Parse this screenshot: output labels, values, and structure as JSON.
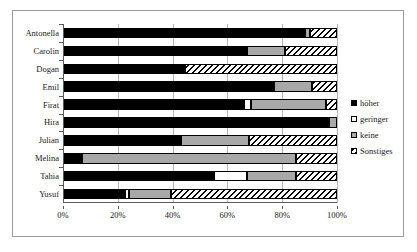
{
  "chart_data": {
    "type": "bar",
    "orientation": "horizontal",
    "stacked": true,
    "stack_mode": "percent",
    "title": "",
    "subtitle": "",
    "xlabel": "",
    "ylabel": "",
    "xlim": [
      0,
      100
    ],
    "xticks": [
      0,
      20,
      40,
      60,
      80,
      100
    ],
    "xtick_labels": [
      "0%",
      "20%",
      "40%",
      "60%",
      "80%",
      "100%"
    ],
    "grid": true,
    "grid_axis": "x",
    "legend_position": "right",
    "categories": [
      "Antonella",
      "Carolin",
      "Dogan",
      "Emil",
      "Firat",
      "Hira",
      "Julian",
      "Melina",
      "Tahia",
      "Yusuf"
    ],
    "series": [
      {
        "name": "höher",
        "color": "#000000",
        "pattern": "solid",
        "values": [
          88.3,
          67.0,
          44.5,
          77.0,
          66.0,
          97.0,
          43.0,
          7.0,
          55.0,
          22.5
        ]
      },
      {
        "name": "geringer",
        "color": "#ffffff",
        "pattern": "solid",
        "values": [
          0.0,
          0.0,
          0.0,
          0.0,
          2.5,
          0.0,
          0.0,
          0.0,
          12.0,
          1.5
        ]
      },
      {
        "name": "keine",
        "color": "#a8a8a8",
        "pattern": "solid",
        "values": [
          1.7,
          14.0,
          0.0,
          14.0,
          27.5,
          3.0,
          25.0,
          78.0,
          18.0,
          15.5
        ]
      },
      {
        "name": "Sonstiges",
        "color": "#ffffff",
        "pattern": "diagonal-hatch",
        "values": [
          10.0,
          19.0,
          55.5,
          9.0,
          4.0,
          0.0,
          32.0,
          15.0,
          15.0,
          60.5
        ]
      }
    ]
  },
  "legend": {
    "items": [
      {
        "label": "höher"
      },
      {
        "label": "geringer"
      },
      {
        "label": "keine"
      },
      {
        "label": "Sonstiges"
      }
    ]
  },
  "colors": {
    "hoeher": "#000000",
    "geringer": "#ffffff",
    "keine": "#a8a8a8",
    "sonstiges_line": "#000000",
    "frame_border": "#9a9a9a",
    "gridline": "#b4b4b4",
    "axis": "#5a5a5a",
    "background": "#ffffff"
  }
}
